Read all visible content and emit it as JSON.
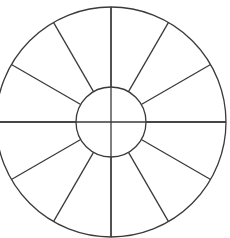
{
  "diagram": {
    "type": "segmented-wheel",
    "center": [
      111,
      122
    ],
    "outer_radius": 115,
    "inner_radius": 35,
    "segments": 12,
    "spoke_angles_deg": [
      0,
      30,
      60,
      90,
      120,
      150,
      180,
      210,
      240,
      270,
      300,
      330
    ],
    "full_diameters": [
      0,
      90
    ],
    "stroke_color": "#3a3a3a",
    "background_color": "#ffffff"
  }
}
